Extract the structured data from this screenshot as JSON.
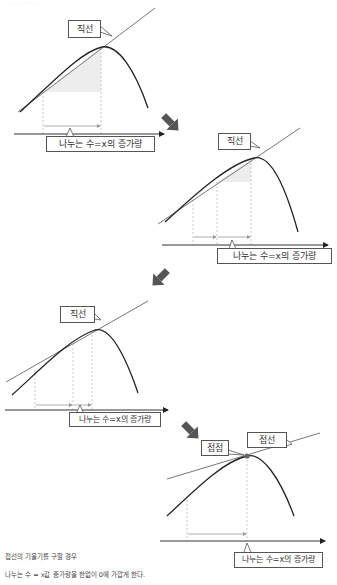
{
  "header": {
    "faded_title": "····· ····· ·····"
  },
  "diagrams": [
    {
      "id": 1,
      "line_label": "직선",
      "axis_label": "나누는 수=x의 증가량"
    },
    {
      "id": 2,
      "line_label": "직선",
      "axis_label": "나누는 수=x의 증가량"
    },
    {
      "id": 3,
      "line_label": "직선",
      "axis_label": "나누는 수=x의 증가량"
    },
    {
      "id": 4,
      "point_label": "접점",
      "line_label": "접선",
      "axis_label": "나누는 수=x의 증가량"
    }
  ],
  "caption": {
    "line1": "접선의 기울기를 구할 경우",
    "line2": "나누는 수 = x값 증가량을 한없이 0에 가깝게 한다."
  },
  "colors": {
    "curve": "#222222",
    "line": "#777777",
    "axis": "#333333",
    "dashed": "#bbbbbb",
    "shade": "#ededed",
    "arrow": "#555555"
  }
}
